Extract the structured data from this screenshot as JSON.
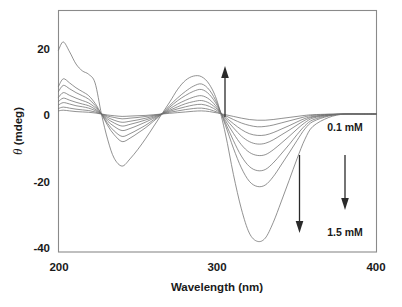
{
  "figure": {
    "background_color": "#ffffff",
    "frame_color": "#8a8a8a",
    "curve_color": "#6e6e6e",
    "text_color": "#1a1a1a"
  },
  "axes": {
    "x_title": "Wavelength (nm)",
    "y_title_symbol": "θ",
    "y_title_unit": " (mdeg)",
    "x_ticks": [
      "200",
      "300",
      "400"
    ],
    "y_ticks": [
      "20",
      "0",
      "-20",
      "-40"
    ]
  },
  "annotations": {
    "top_concentration": "0.1 mM",
    "bottom_concentration": "1.5 mM",
    "up_arrow": "up-arrow",
    "down_arrow_curves": "down-arrow",
    "down_arrow_legend": "down-arrow"
  },
  "chart_data": {
    "type": "line",
    "title": "",
    "xlabel": "Wavelength (nm)",
    "ylabel": "θ (mdeg)",
    "xlim": [
      200,
      400
    ],
    "ylim": [
      -40,
      30
    ],
    "xticks": [
      200,
      300,
      400
    ],
    "yticks": [
      20,
      0,
      -20,
      -40
    ],
    "grid": false,
    "legend": "annotated arrows",
    "legend_position": "right",
    "x_unit": "nm",
    "y_unit": "mdeg",
    "series_label_top": "0.1 mM",
    "series_label_bottom": "1.5 mM",
    "x": [
      200,
      203,
      207,
      211,
      215,
      219,
      223,
      227,
      231,
      235,
      240,
      245,
      250,
      255,
      260,
      265,
      270,
      275,
      280,
      285,
      290,
      295,
      300,
      305,
      310,
      315,
      320,
      325,
      330,
      335,
      340,
      345,
      350,
      355,
      360,
      370,
      380,
      390,
      400
    ],
    "series": [
      {
        "name": "0.1 mM",
        "concentration_mM": 0.1,
        "values": [
          0.9,
          1.1,
          0.9,
          0.7,
          0.6,
          0.5,
          0.3,
          0.0,
          -0.3,
          -0.5,
          -0.7,
          -0.6,
          -0.5,
          -0.4,
          -0.2,
          0.0,
          0.2,
          0.4,
          0.6,
          0.8,
          0.9,
          0.7,
          0.3,
          -0.2,
          -0.7,
          -1.2,
          -1.6,
          -1.8,
          -1.8,
          -1.6,
          -1.3,
          -1.0,
          -0.7,
          -0.4,
          -0.2,
          -0.05,
          0.0,
          0.0,
          0.0
        ]
      },
      {
        "name": "0.3 mM",
        "concentration_mM": 0.3,
        "values": [
          1.6,
          2.0,
          1.7,
          1.4,
          1.2,
          1.0,
          0.6,
          0.0,
          -0.6,
          -1.0,
          -1.4,
          -1.2,
          -1.0,
          -0.7,
          -0.4,
          0.0,
          0.5,
          0.9,
          1.3,
          1.6,
          1.7,
          1.3,
          0.5,
          -0.5,
          -1.6,
          -2.6,
          -3.3,
          -3.7,
          -3.6,
          -3.2,
          -2.6,
          -2.0,
          -1.4,
          -0.8,
          -0.4,
          -0.1,
          0.0,
          0.0,
          0.0
        ]
      },
      {
        "name": "0.5 mM",
        "concentration_mM": 0.5,
        "values": [
          2.6,
          3.3,
          2.9,
          2.4,
          2.1,
          1.7,
          1.0,
          0.0,
          -1.0,
          -1.8,
          -2.4,
          -2.1,
          -1.7,
          -1.2,
          -0.6,
          0.0,
          0.8,
          1.5,
          2.1,
          2.6,
          2.8,
          2.2,
          0.9,
          -0.9,
          -2.8,
          -4.5,
          -5.7,
          -6.2,
          -6.1,
          -5.4,
          -4.4,
          -3.4,
          -2.3,
          -1.3,
          -0.7,
          -0.2,
          0.0,
          0.0,
          0.0
        ]
      },
      {
        "name": "0.7 mM",
        "concentration_mM": 0.7,
        "values": [
          3.6,
          4.6,
          4.0,
          3.4,
          2.9,
          2.4,
          1.4,
          0.0,
          -1.5,
          -2.6,
          -3.5,
          -3.0,
          -2.4,
          -1.7,
          -0.9,
          0.0,
          1.1,
          2.1,
          3.0,
          3.6,
          3.9,
          3.1,
          1.3,
          -1.3,
          -4.0,
          -6.4,
          -8.0,
          -8.7,
          -8.5,
          -7.5,
          -6.1,
          -4.7,
          -3.2,
          -1.8,
          -0.9,
          -0.25,
          0.0,
          0.0,
          0.0
        ]
      },
      {
        "name": "0.9 mM",
        "concentration_mM": 0.9,
        "values": [
          4.8,
          6.2,
          5.4,
          4.6,
          3.9,
          3.2,
          1.9,
          0.0,
          -2.1,
          -3.6,
          -4.8,
          -4.2,
          -3.3,
          -2.3,
          -1.2,
          0.0,
          1.5,
          2.9,
          4.0,
          4.9,
          5.3,
          4.2,
          1.7,
          -1.9,
          -5.6,
          -8.9,
          -11.1,
          -12.0,
          -11.8,
          -10.4,
          -8.5,
          -6.5,
          -4.4,
          -2.5,
          -1.2,
          -0.35,
          0.0,
          0.0,
          0.0
        ]
      },
      {
        "name": "1.1 mM",
        "concentration_mM": 1.1,
        "values": [
          6.5,
          8.3,
          7.3,
          6.2,
          5.3,
          4.3,
          2.5,
          0.0,
          -2.8,
          -4.9,
          -6.5,
          -5.7,
          -4.5,
          -3.2,
          -1.6,
          0.0,
          2.0,
          3.9,
          5.4,
          6.6,
          7.1,
          5.6,
          2.3,
          -2.6,
          -7.7,
          -12.2,
          -15.2,
          -16.4,
          -16.1,
          -14.2,
          -11.6,
          -8.9,
          -6.0,
          -3.4,
          -1.7,
          -0.45,
          0.0,
          0.0,
          0.0
        ]
      },
      {
        "name": "1.3 mM",
        "concentration_mM": 1.3,
        "values": [
          8.0,
          10.2,
          9.0,
          7.6,
          6.5,
          5.3,
          3.1,
          0.0,
          -3.4,
          -6.0,
          -8.0,
          -7.0,
          -5.5,
          -3.9,
          -2.0,
          0.0,
          2.5,
          4.7,
          6.6,
          8.1,
          8.7,
          6.9,
          2.8,
          -3.3,
          -9.9,
          -15.6,
          -19.5,
          -21.0,
          -20.6,
          -18.2,
          -14.8,
          -11.3,
          -7.7,
          -4.3,
          -2.2,
          -0.6,
          0.0,
          0.0,
          0.0
        ]
      },
      {
        "name": "1.5 mM",
        "concentration_mM": 1.5,
        "values": [
          18.5,
          20.9,
          18.0,
          14.5,
          12.5,
          11.5,
          9.0,
          0.0,
          -7.5,
          -12.8,
          -15.1,
          -13.0,
          -10.2,
          -7.0,
          -3.5,
          0.0,
          3.5,
          7.2,
          9.8,
          11.0,
          10.8,
          8.5,
          3.4,
          -5.8,
          -17.5,
          -27.5,
          -34.5,
          -36.9,
          -36.0,
          -31.5,
          -25.5,
          -19.3,
          -13.0,
          -7.3,
          -3.6,
          -1.0,
          0.0,
          0.0,
          0.0
        ]
      }
    ],
    "band_maxima": [
      {
        "wavelength_nm": 203,
        "label": "positive band"
      },
      {
        "wavelength_nm": 290,
        "label": "positive band"
      }
    ],
    "band_minima": [
      {
        "wavelength_nm": 240,
        "label": "negative band"
      },
      {
        "wavelength_nm": 325,
        "label": "negative band"
      }
    ]
  }
}
